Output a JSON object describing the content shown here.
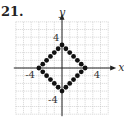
{
  "problem_number": "21.",
  "chart_data": {
    "type": "scatter",
    "title": "",
    "xlabel": "x",
    "ylabel": "y",
    "xlim": [
      -6,
      6
    ],
    "ylim": [
      -6,
      6
    ],
    "grid": true,
    "x_tick_labels": [
      "-4",
      "4"
    ],
    "y_tick_labels": [
      "4",
      "-4"
    ],
    "points": [
      [
        0,
        3
      ],
      [
        0.5,
        2.5
      ],
      [
        1,
        2
      ],
      [
        1.5,
        1.5
      ],
      [
        2,
        1
      ],
      [
        2.5,
        0.5
      ],
      [
        3,
        0
      ],
      [
        2.5,
        -0.5
      ],
      [
        2,
        -1
      ],
      [
        1.5,
        -1.5
      ],
      [
        1,
        -2
      ],
      [
        0.5,
        -2.5
      ],
      [
        0,
        -3
      ],
      [
        -0.5,
        -2.5
      ],
      [
        -1,
        -2
      ],
      [
        -1.5,
        -1.5
      ],
      [
        -2,
        -1
      ],
      [
        -2.5,
        -0.5
      ],
      [
        -3,
        0
      ],
      [
        -2.5,
        0.5
      ],
      [
        -2,
        1
      ],
      [
        -1.5,
        1.5
      ],
      [
        -1,
        2
      ],
      [
        -0.5,
        2.5
      ]
    ]
  }
}
